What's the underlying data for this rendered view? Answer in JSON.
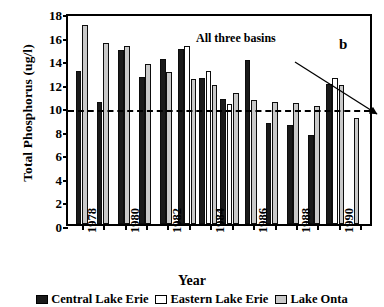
{
  "chart_data": {
    "type": "bar",
    "title": "",
    "panel_label": "b",
    "xlabel": "Year",
    "ylabel": "Total Phosphorus (ug/l)",
    "ylim": [
      0,
      18
    ],
    "ytick_values": [
      0,
      2,
      4,
      6,
      8,
      10,
      12,
      14,
      16,
      18
    ],
    "ytick_labels": [
      "0",
      "2",
      "4",
      "6",
      "8",
      "10",
      "12",
      "14",
      "16",
      "18"
    ],
    "grid": false,
    "legend_position": "bottom",
    "categories": [
      "1978",
      "1979",
      "1980",
      "1981",
      "1982",
      "1983",
      "1984",
      "1985",
      "1986",
      "1987",
      "1988",
      "1989",
      "1990",
      "1991"
    ],
    "xtick_labels": [
      "1978",
      "1980",
      "1982",
      "1984",
      "1986",
      "1988",
      "1990"
    ],
    "series": [
      {
        "name": "Central Lake Erie",
        "color": "#1a1a1a",
        "values": [
          13.0,
          10.4,
          14.8,
          12.5,
          14.0,
          14.9,
          12.4,
          10.6,
          13.9,
          8.6,
          8.4,
          7.6,
          11.9,
          null
        ]
      },
      {
        "name": "Eastern Lake Erie",
        "color": "#ffffff",
        "values": [
          null,
          null,
          null,
          null,
          null,
          15.1,
          13.0,
          10.2,
          null,
          null,
          null,
          null,
          12.4,
          null
        ]
      },
      {
        "name": "Lake Ontario",
        "color": "#c9c9c9",
        "values": [
          16.9,
          15.4,
          15.1,
          13.6,
          12.9,
          12.3,
          11.8,
          11.1,
          10.5,
          10.4,
          10.3,
          10.0,
          11.8,
          9.0
        ]
      }
    ],
    "annotations": [
      {
        "text": "All three basins",
        "reference_line_value": 10,
        "reference_line_style": "dashed"
      }
    ]
  },
  "legend": {
    "items": [
      {
        "label": "Central Lake Erie",
        "swatch": "black-square-swatch"
      },
      {
        "label": "Eastern Lake Erie",
        "swatch": "white-square-swatch"
      },
      {
        "label": "Lake Onta",
        "swatch": "gray-square-swatch"
      }
    ]
  }
}
